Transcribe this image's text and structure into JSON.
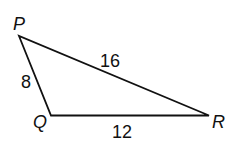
{
  "diagram": {
    "type": "triangle",
    "vertices": [
      {
        "name": "P",
        "label": "P"
      },
      {
        "name": "Q",
        "label": "Q"
      },
      {
        "name": "R",
        "label": "R"
      }
    ],
    "sides": [
      {
        "between": "PQ",
        "length": "8"
      },
      {
        "between": "PR",
        "length": "16"
      },
      {
        "between": "QR",
        "length": "12"
      }
    ],
    "line_color": "#111111"
  }
}
